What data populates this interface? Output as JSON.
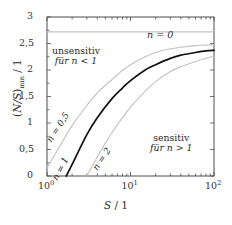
{
  "chart_data": {
    "type": "line",
    "title": "",
    "xlabel": "S / 1",
    "ylabel": "(N/S)min / 1",
    "xscale": "log",
    "yscale": "linear",
    "xlim": [
      1,
      100
    ],
    "ylim": [
      0,
      3
    ],
    "grid": false,
    "legend_position": "inline-curve-labels",
    "xticks": [
      {
        "value": 1,
        "label": "10",
        "exponent": "0"
      },
      {
        "value": 10,
        "label": "10",
        "exponent": "1"
      },
      {
        "value": 100,
        "label": "10",
        "exponent": "2"
      }
    ],
    "yticks": [
      {
        "value": 0,
        "label": "0"
      },
      {
        "value": 0.5,
        "label": "0,5"
      },
      {
        "value": 1,
        "label": "1"
      },
      {
        "value": 1.5,
        "label": "1,5"
      },
      {
        "value": 2,
        "label": "2"
      },
      {
        "value": 2.5,
        "label": "2,5"
      },
      {
        "value": 3,
        "label": "3"
      }
    ],
    "series": [
      {
        "name": "n = 0",
        "label": "n = 0",
        "color": "#c2c2c2",
        "style": "flat",
        "x": [
          1,
          100
        ],
        "values": [
          2.72,
          2.72
        ]
      },
      {
        "name": "n = 0,5",
        "label": "n = 0,5",
        "color": "#c2c2c2",
        "style": "curve",
        "x": [
          1,
          1.5,
          2,
          3,
          4,
          6,
          8,
          10,
          15,
          20,
          30,
          40,
          60,
          80,
          100
        ],
        "values": [
          0.15,
          0.62,
          0.95,
          1.33,
          1.57,
          1.82,
          1.99,
          2.1,
          2.25,
          2.33,
          2.4,
          2.43,
          2.46,
          2.47,
          2.48
        ]
      },
      {
        "name": "n = 1",
        "label": "n = 1",
        "color": "#111111",
        "style": "curve",
        "x": [
          1.7,
          2,
          3,
          4,
          6,
          8,
          10,
          15,
          20,
          30,
          40,
          60,
          80,
          100
        ],
        "values": [
          0.0,
          0.22,
          0.78,
          1.1,
          1.46,
          1.66,
          1.8,
          2.0,
          2.1,
          2.22,
          2.28,
          2.33,
          2.36,
          2.37
        ]
      },
      {
        "name": "n = 2",
        "label": "n = 2",
        "color": "#c2c2c2",
        "style": "curve",
        "x": [
          3,
          4,
          5,
          6,
          8,
          10,
          15,
          20,
          30,
          40,
          60,
          80,
          100
        ],
        "values": [
          0.0,
          0.36,
          0.62,
          0.82,
          1.1,
          1.3,
          1.6,
          1.78,
          1.97,
          2.06,
          2.16,
          2.22,
          2.26
        ]
      }
    ],
    "annotations": [
      {
        "name": "unsensitive-region",
        "line1": "unsensitiv",
        "line2": "für n < 1"
      },
      {
        "name": "sensitive-region",
        "line1": "sensitiv",
        "line2": "für n > 1"
      }
    ]
  },
  "axes": {
    "x_title_var": "S",
    "x_title_sep": " / ",
    "x_title_unit": "1",
    "y_title_open": "(",
    "y_title_var": "N/S",
    "y_title_close": ")",
    "y_title_sub": "min",
    "y_title_sep": " / ",
    "y_title_unit": "1"
  },
  "curve_labels": {
    "n0": "n = 0",
    "n05": "n = 0,5",
    "n1": "n = 1",
    "n2": "n = 2"
  },
  "regions": {
    "unsensitive_line1": "unsensitiv",
    "unsensitive_line2": "für n < 1",
    "sensitive_line1": "sensitiv",
    "sensitive_line2": "für n > 1"
  },
  "colors": {
    "curve_main": "#111111",
    "curve_secondary": "#c2c2c2",
    "frame": "#4d4d4d",
    "text": "#2b2b2b",
    "background": "#ffffff"
  }
}
